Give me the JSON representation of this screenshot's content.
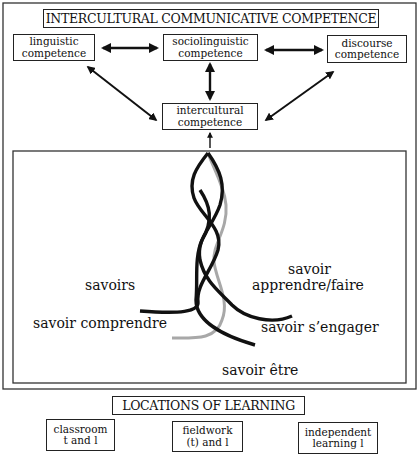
{
  "diagram": {
    "top_title": "INTERCULTURAL COMMUNICATIVE COMPETENCE",
    "competences": {
      "linguistic": [
        "linguistic",
        "competence"
      ],
      "sociolinguistic": [
        "sociolinguistic",
        "competence"
      ],
      "discourse": [
        "discourse",
        "competence"
      ],
      "intercultural": [
        "intercultural",
        "competence"
      ]
    },
    "savoirs": {
      "savoirs": "savoirs",
      "apprendre_1": "savoir",
      "apprendre_2": "apprendre/faire",
      "comprendre": "savoir comprendre",
      "engager": "savoir s’engager",
      "etre": "savoir être"
    },
    "locations_title": "LOCATIONS OF LEARNING",
    "locations": [
      [
        "classroom",
        "t and l"
      ],
      [
        "fieldwork",
        "(t) and l"
      ],
      [
        "independent",
        "learning l"
      ]
    ],
    "colors": {
      "ink": "#111111",
      "grey_strand": "#a8a8a8",
      "border": "#222222"
    }
  }
}
